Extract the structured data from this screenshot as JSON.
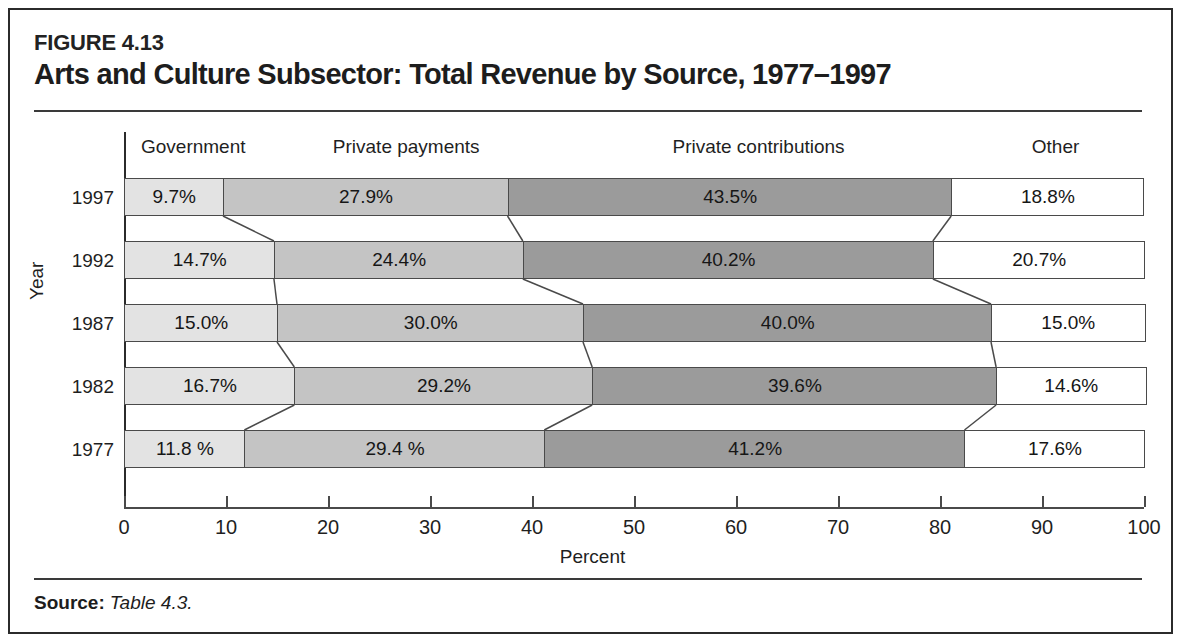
{
  "figure": {
    "number": "FIGURE 4.13",
    "title": "Arts and Culture Subsector: Total Revenue by Source, 1977–1997"
  },
  "source": {
    "label": "Source:",
    "value": "Table 4.3."
  },
  "chart_data": {
    "type": "bar",
    "orientation": "horizontal",
    "stacked": true,
    "stack_total": 100,
    "title": "Arts and Culture Subsector: Total Revenue by Source, 1977–1997",
    "xlabel": "Percent",
    "ylabel": "Year",
    "xlim": [
      0,
      100
    ],
    "xticks": [
      0,
      10,
      20,
      30,
      40,
      50,
      60,
      70,
      80,
      90,
      100
    ],
    "xtick_labels": [
      "0",
      "10",
      "20",
      "30",
      "40",
      "50",
      "60",
      "70",
      "80",
      "90",
      "100"
    ],
    "grid": false,
    "legend_position": "top-column-headers",
    "categories": [
      "1997",
      "1992",
      "1987",
      "1982",
      "1977"
    ],
    "column_headers": [
      "Government",
      "Private payments",
      "Private contributions",
      "Other"
    ],
    "series": [
      {
        "name": "Government",
        "color": "#e3e3e3",
        "values": [
          9.7,
          14.7,
          15.0,
          16.7,
          11.8
        ]
      },
      {
        "name": "Private payments",
        "color": "#c4c4c4",
        "values": [
          27.9,
          24.4,
          30.0,
          29.2,
          29.4
        ]
      },
      {
        "name": "Private contributions",
        "color": "#9b9b9b",
        "values": [
          43.5,
          40.2,
          40.0,
          39.6,
          41.2
        ]
      },
      {
        "name": "Other",
        "color": "#ffffff",
        "values": [
          18.8,
          20.7,
          15.0,
          14.6,
          17.6
        ]
      }
    ],
    "rows": [
      {
        "year": "1997",
        "labels": [
          "9.7%",
          "27.9%",
          "43.5%",
          "18.8%"
        ],
        "values": [
          9.7,
          27.9,
          43.5,
          18.8
        ]
      },
      {
        "year": "1992",
        "labels": [
          "14.7%",
          "24.4%",
          "40.2%",
          "20.7%"
        ],
        "values": [
          14.7,
          24.4,
          40.2,
          20.7
        ]
      },
      {
        "year": "1987",
        "labels": [
          "15.0%",
          "30.0%",
          "40.0%",
          "15.0%"
        ],
        "values": [
          15.0,
          30.0,
          40.0,
          15.0
        ]
      },
      {
        "year": "1982",
        "labels": [
          "16.7%",
          "29.2%",
          "39.6%",
          "14.6%"
        ],
        "values": [
          16.7,
          29.2,
          39.6,
          14.6
        ]
      },
      {
        "year": "1977",
        "labels": [
          "11.8 %",
          "29.4 %",
          "41.2%",
          "17.6%"
        ],
        "values": [
          11.8,
          29.4,
          41.2,
          17.6
        ]
      }
    ]
  }
}
